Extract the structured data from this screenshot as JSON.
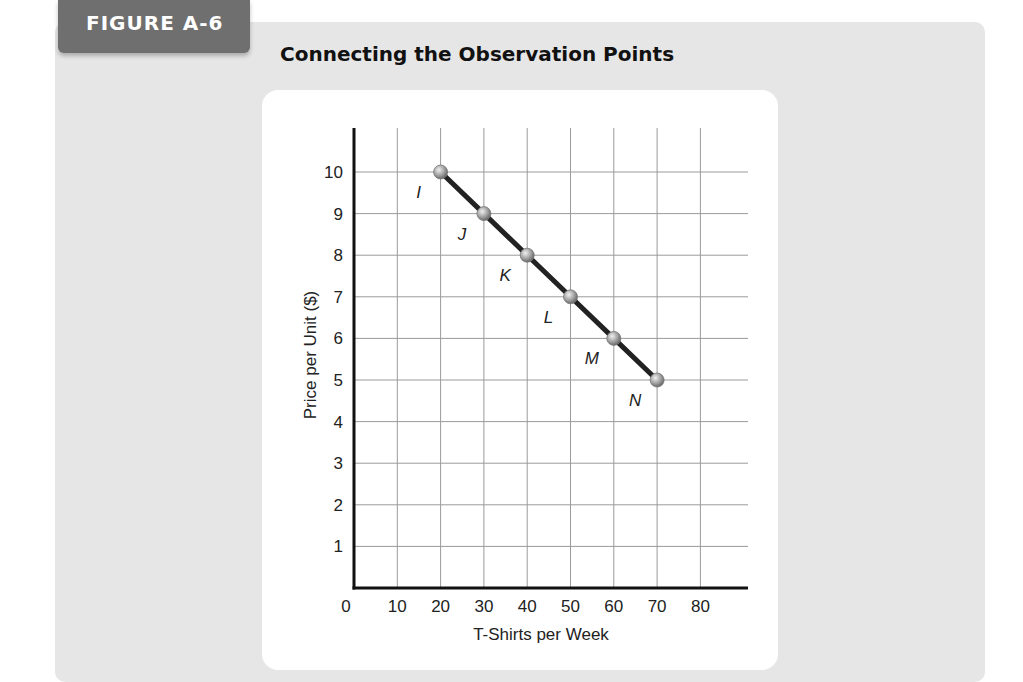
{
  "figure": {
    "label": "FIGURE A-6",
    "title": "Connecting the Observation Points"
  },
  "colors": {
    "panel": "#e6e6e6",
    "tab": "#6f6f6f",
    "line": "#222222",
    "point": "#a8a8a8"
  },
  "chart_data": {
    "type": "line",
    "title": "Connecting the Observation Points",
    "xlabel": "T-Shirts per Week",
    "ylabel": "Price per Unit ($)",
    "x_ticks": [
      "0",
      "10",
      "20",
      "30",
      "40",
      "50",
      "60",
      "70",
      "80"
    ],
    "y_ticks": [
      "1",
      "2",
      "3",
      "4",
      "5",
      "6",
      "7",
      "8",
      "9",
      "10"
    ],
    "xlim": [
      0,
      85
    ],
    "ylim": [
      0,
      11.5
    ],
    "grid": true,
    "legend": "none",
    "points": [
      {
        "label": "I",
        "x": 20,
        "y": 10
      },
      {
        "label": "J",
        "x": 30,
        "y": 9
      },
      {
        "label": "K",
        "x": 40,
        "y": 8
      },
      {
        "label": "L",
        "x": 50,
        "y": 7
      },
      {
        "label": "M",
        "x": 60,
        "y": 6
      },
      {
        "label": "N",
        "x": 70,
        "y": 5
      }
    ]
  }
}
